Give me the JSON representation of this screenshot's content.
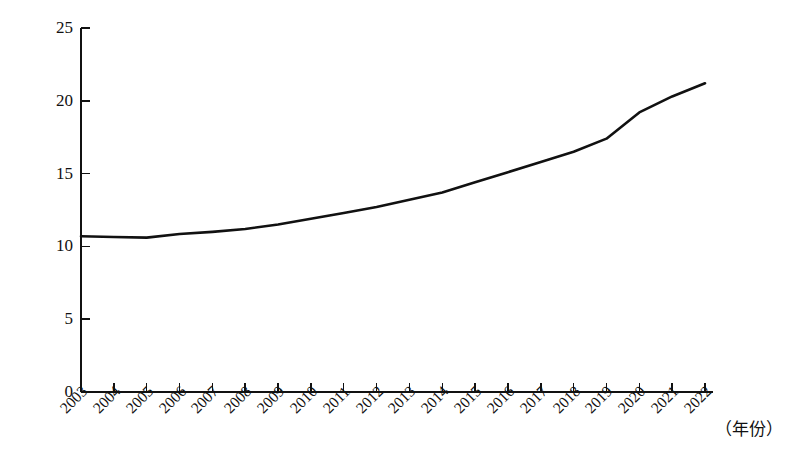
{
  "chart_data": {
    "type": "line",
    "title": "",
    "subtitle": "",
    "xlabel": "（年份）",
    "ylabel": "",
    "grid": false,
    "legend": false,
    "legend_position": "none",
    "xlim": [
      2003,
      2022
    ],
    "ylim": [
      0,
      25
    ],
    "yticks": [
      0,
      5,
      10,
      15,
      20,
      25
    ],
    "ytick_labels": [
      "0",
      "5",
      "10",
      "15",
      "20",
      "25"
    ],
    "categories": [
      "2003",
      "2004",
      "2005",
      "2006",
      "2007",
      "2008",
      "2009",
      "2010",
      "2011",
      "2012",
      "2013",
      "2014",
      "2015",
      "2016",
      "2017",
      "2018",
      "2019",
      "2020",
      "2021",
      "2022"
    ],
    "series": [
      {
        "name": "",
        "color": "#111111",
        "values": [
          10.7,
          10.65,
          10.6,
          10.85,
          11.0,
          11.2,
          11.5,
          11.9,
          12.3,
          12.7,
          13.2,
          13.7,
          14.4,
          15.1,
          15.8,
          16.5,
          17.4,
          19.2,
          20.3,
          21.2
        ]
      }
    ],
    "annotations": []
  },
  "axes": {
    "y_axis_name": "y-axis",
    "x_axis_name": "x-axis",
    "x_unit_label": "（年份）"
  }
}
